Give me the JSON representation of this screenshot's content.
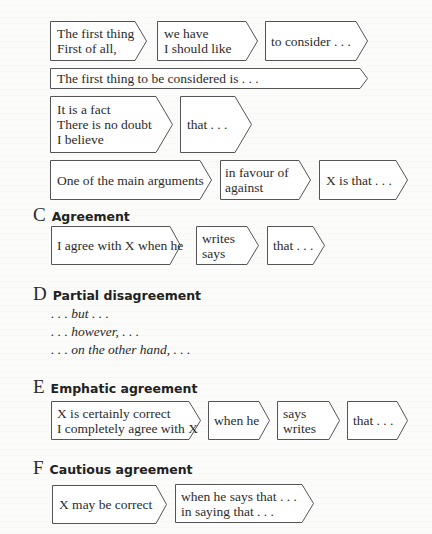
{
  "section_b": {
    "rows": [
      {
        "boxes": [
          {
            "lines": [
              "The first thing",
              "First of all,"
            ]
          },
          {
            "lines": [
              "we have",
              "I should like"
            ]
          },
          {
            "lines": [
              "to consider . . ."
            ]
          }
        ]
      },
      {
        "boxes": [
          {
            "lines": [
              "The first thing to be considered is . . ."
            ]
          }
        ]
      },
      {
        "boxes": [
          {
            "lines": [
              "It is a fact",
              "There is no doubt",
              "I believe"
            ]
          },
          {
            "lines": [
              "that . . ."
            ]
          }
        ]
      },
      {
        "boxes": [
          {
            "lines": [
              "One of the main arguments"
            ]
          },
          {
            "lines": [
              "in favour of",
              "against"
            ]
          },
          {
            "lines": [
              "X is that . . ."
            ]
          }
        ]
      }
    ]
  },
  "section_c": {
    "letter": "C",
    "title": "Agreement",
    "boxes": [
      {
        "lines": [
          "I agree with X when he"
        ]
      },
      {
        "lines": [
          "writes",
          "says"
        ]
      },
      {
        "lines": [
          "that . . ."
        ]
      }
    ]
  },
  "section_d": {
    "letter": "D",
    "title": "Partial disagreement",
    "phrases": [
      ". . . but . . .",
      ". . . however, . . .",
      ". . . on the other hand, . . ."
    ]
  },
  "section_e": {
    "letter": "E",
    "title": "Emphatic agreement",
    "boxes": [
      {
        "lines": [
          "X is certainly correct",
          "I completely agree with X"
        ]
      },
      {
        "lines": [
          "when he"
        ]
      },
      {
        "lines": [
          "says",
          "writes"
        ]
      },
      {
        "lines": [
          "that . . ."
        ]
      }
    ]
  },
  "section_f": {
    "letter": "F",
    "title": "Cautious agreement",
    "boxes": [
      {
        "lines": [
          "X may be correct"
        ]
      },
      {
        "lines": [
          "when he says that . . .",
          "in saying that . . ."
        ]
      }
    ]
  },
  "colors": {
    "background": "#fbfbfa",
    "box_stroke": "#555555",
    "text": "#2c2c2c"
  }
}
